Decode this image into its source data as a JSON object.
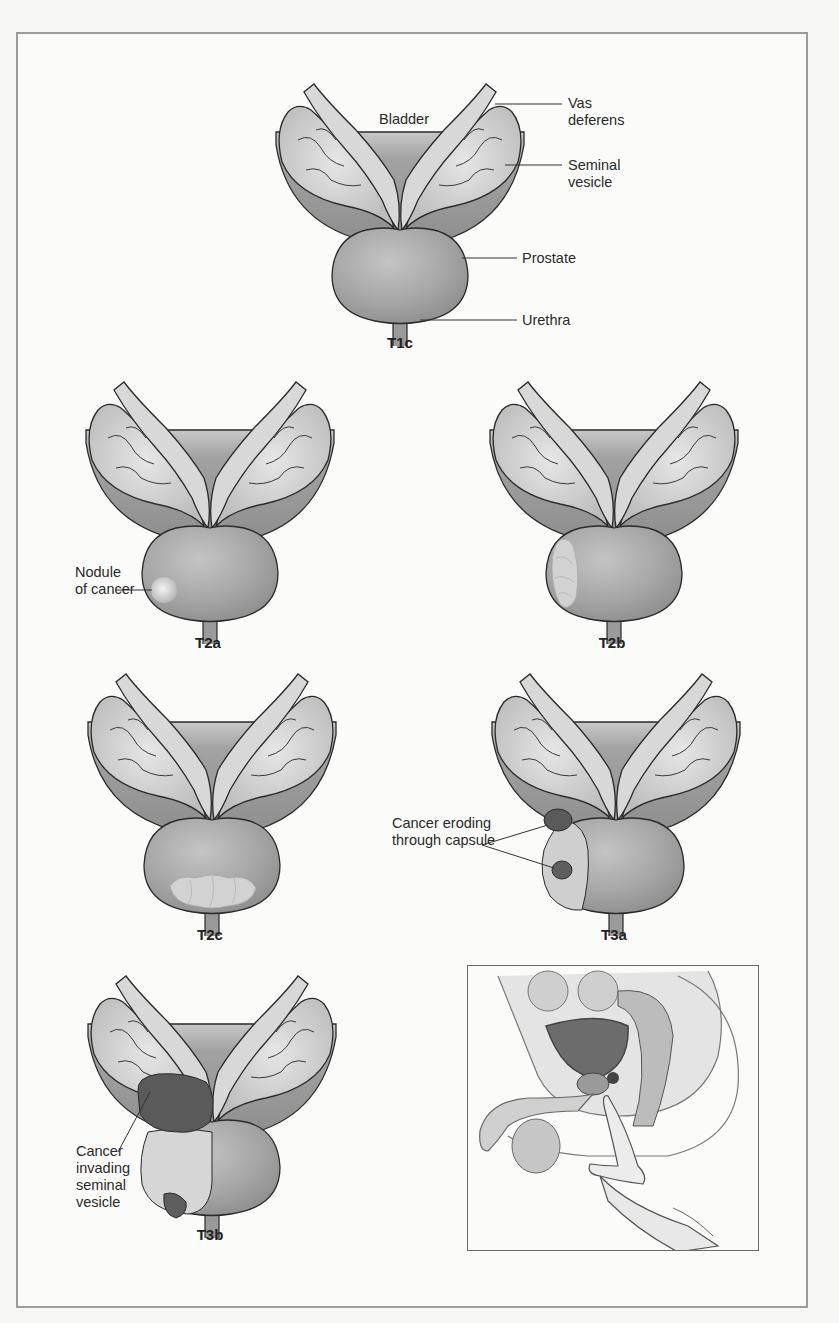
{
  "figure": {
    "colors": {
      "background": "#fbfbfa",
      "frame_border": "#9c9c9c",
      "bladder": "#9a9a9a",
      "vesicle": "#d4d4d4",
      "prostate": "#a8a8a8",
      "tumor_light": "#dcdcdc",
      "tumor_dark": "#5a5a5a",
      "outline": "#2a2a2a"
    },
    "panels": [
      {
        "id": "t1c",
        "stage": "T1c",
        "callouts": [
          {
            "text": "Bladder"
          },
          {
            "text": "Vas\ndeferens"
          },
          {
            "text": "Seminal\nvesicle"
          },
          {
            "text": "Prostate"
          },
          {
            "text": "Urethra"
          }
        ]
      },
      {
        "id": "t2a",
        "stage": "T2a",
        "callouts": [
          {
            "text": "Nodule\nof cancer"
          }
        ]
      },
      {
        "id": "t2b",
        "stage": "T2b",
        "callouts": []
      },
      {
        "id": "t2c",
        "stage": "T2c",
        "callouts": []
      },
      {
        "id": "t3a",
        "stage": "T3a",
        "callouts": [
          {
            "text": "Cancer eroding\nthrough capsule"
          }
        ]
      },
      {
        "id": "t3b",
        "stage": "T3b",
        "callouts": [
          {
            "text": "Cancer\ninvading\nseminal\nvesicle"
          }
        ]
      }
    ],
    "inset": {
      "subject": "digital rectal examination (sagittal view)"
    }
  }
}
